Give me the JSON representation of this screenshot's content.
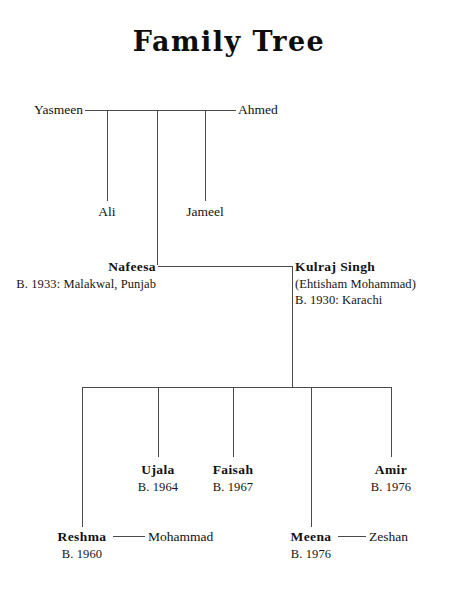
{
  "document": {
    "title": "Family Tree"
  },
  "generations": {
    "g1": {
      "spouse_left": {
        "name": "Yasmeen"
      },
      "spouse_right": {
        "name": "Ahmed"
      },
      "children": [
        {
          "name": "Ali"
        },
        {
          "name": "Jameel"
        }
      ]
    },
    "g2": {
      "spouse_left": {
        "name": "Nafeesa",
        "birth": "B. 1933: Malakwal, Punjab"
      },
      "spouse_right": {
        "name": "Kulraj Singh",
        "alias": "(Ehtisham Mohammad)",
        "birth": "B. 1930: Karachi"
      }
    },
    "g3": {
      "children": [
        {
          "name": "Reshma",
          "birth": "B. 1960",
          "spouse": "Mohammad"
        },
        {
          "name": "Ujala",
          "birth": "B. 1964"
        },
        {
          "name": "Faisah",
          "birth": "B. 1967"
        },
        {
          "name": "Meena",
          "birth": "B. 1976",
          "spouse": "Zeshan"
        },
        {
          "name": "Amir",
          "birth": "B. 1976"
        }
      ]
    }
  },
  "style": {
    "line_color": "#4a4a4a",
    "text_color": "#111111",
    "background": "#ffffff"
  }
}
